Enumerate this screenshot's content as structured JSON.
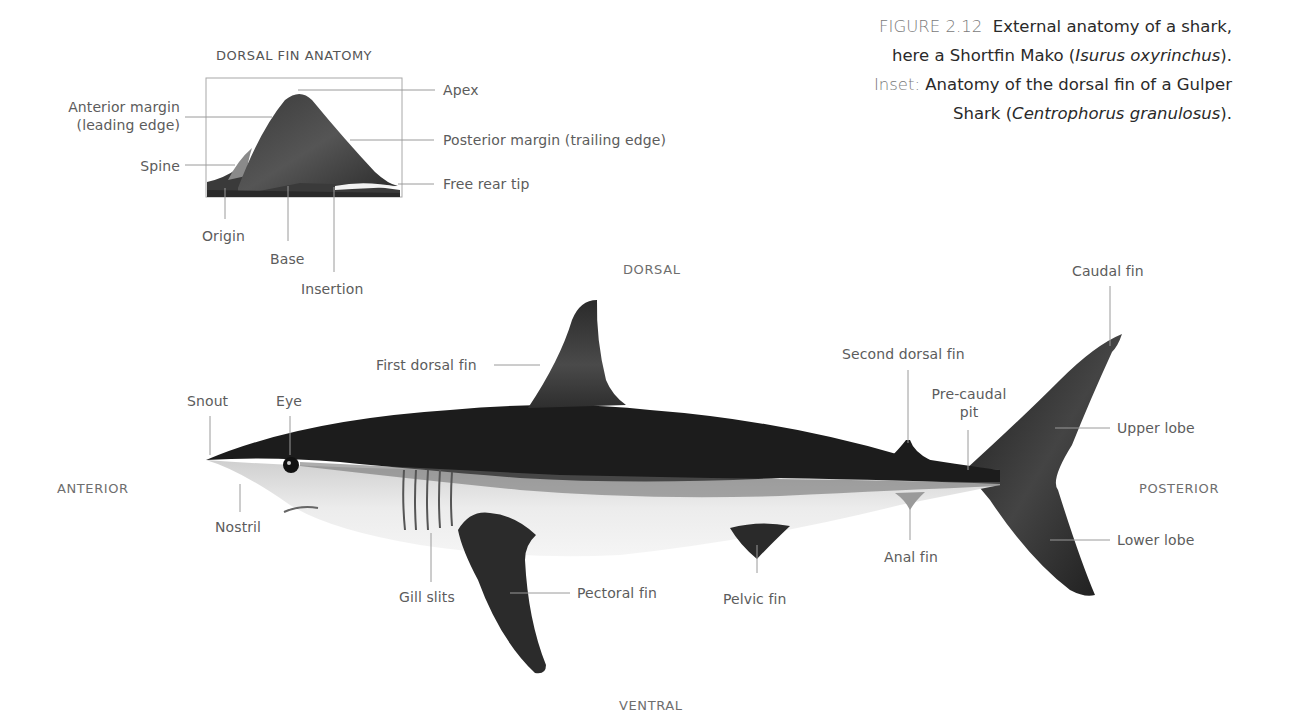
{
  "caption": {
    "figure_number": "FIGURE 2.12",
    "line1_text": "External anatomy of a shark,",
    "line2_prefix": "here a Shortfin Mako (",
    "line2_species": "Isurus oxyrinchus",
    "line2_suffix": ").",
    "inset_label": "Inset:",
    "line3_text": "Anatomy of the dorsal fin of a Gulper",
    "line4_prefix": "Shark (",
    "line4_species": "Centrophorus granulosus",
    "line4_suffix": ")."
  },
  "inset": {
    "title": "DORSAL FIN ANATOMY",
    "labels": {
      "anterior_margin_1": "Anterior margin",
      "anterior_margin_2": "(leading edge)",
      "spine": "Spine",
      "origin": "Origin",
      "base": "Base",
      "insertion": "Insertion",
      "apex": "Apex",
      "posterior_margin": "Posterior margin (trailing edge)",
      "free_rear_tip": "Free rear tip"
    }
  },
  "orientation": {
    "dorsal": "DORSAL",
    "ventral": "VENTRAL",
    "anterior": "ANTERIOR",
    "posterior": "POSTERIOR"
  },
  "shark": {
    "labels": {
      "snout": "Snout",
      "eye": "Eye",
      "nostril": "Nostril",
      "gill_slits": "Gill slits",
      "first_dorsal_fin": "First dorsal fin",
      "pectoral_fin": "Pectoral fin",
      "pelvic_fin": "Pelvic fin",
      "second_dorsal_fin": "Second dorsal fin",
      "pre_caudal_pit_1": "Pre-caudal",
      "pre_caudal_pit_2": "pit",
      "anal_fin": "Anal fin",
      "caudal_fin": "Caudal fin",
      "upper_lobe": "Upper lobe",
      "lower_lobe": "Lower lobe"
    }
  },
  "colors": {
    "label_text": "#5c5c5c",
    "leader_line": "#9a9a9a",
    "shark_dorsal": "#1a1a1a",
    "shark_ventral": "#e6e6e6",
    "caption_text": "#2a2a2a"
  }
}
